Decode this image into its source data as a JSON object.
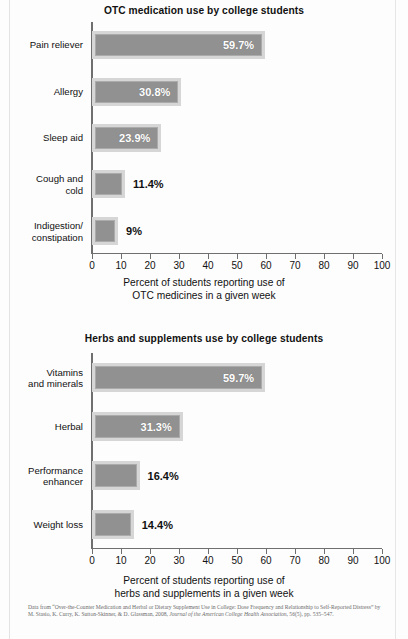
{
  "figures": [
    {
      "id": "otc",
      "title": "OTC medication use by college students",
      "axis_caption": "Percent of students reporting use of\nOTC medicines in a given week"
    },
    {
      "id": "herbs",
      "title": "Herbs and supplements use by college students",
      "axis_caption": "Percent of students reporting use of\nherbs and supplements in a given week"
    }
  ],
  "footnote": {
    "line1": "Data from “Over-the-Counter Medication and Herbal or Dietary Supplement Use in College: Dose Frequency and",
    "line2": "Relationship to Self-Reported Distress” by M. Stasio, K. Curry, K. Sutton-Skinner, & D. Glassman, 2008, ",
    "line2_italic": "Journal",
    "line3_italic": "of the American College Health Association",
    "line3": ", 56(5), pp. 535–547."
  },
  "colors": {
    "bar_fill": "#919191",
    "bar_frame": "#d6d6d6",
    "bar_inner_border": "#ababab",
    "axis": "#6f6f6f",
    "text": "#111111",
    "value_label_inside": "#ffffff",
    "page_background": "#fdfdfd"
  },
  "chart_data": [
    {
      "type": "bar",
      "orientation": "horizontal",
      "title": "OTC medication use by college students",
      "xlabel": "Percent of students reporting use of OTC medicines in a given week",
      "ylabel": "",
      "xlim": [
        0,
        100
      ],
      "xticks": [
        0,
        10,
        20,
        30,
        40,
        50,
        60,
        70,
        80,
        90,
        100
      ],
      "grid": false,
      "legend": "none",
      "categories": [
        "Pain reliever",
        "Allergy",
        "Sleep aid",
        "Cough and cold",
        "Indigestion/ constipation"
      ],
      "values": [
        59.7,
        30.8,
        23.9,
        11.4,
        9
      ],
      "data_labels": [
        "59.7%",
        "30.8%",
        "23.9%",
        "11.4%",
        "9%"
      ],
      "label_placement": [
        "inside",
        "inside",
        "inside",
        "outside",
        "outside"
      ]
    },
    {
      "type": "bar",
      "orientation": "horizontal",
      "title": "Herbs and supplements use by college students",
      "xlabel": "Percent of students reporting use of herbs and supplements in a given week",
      "ylabel": "",
      "xlim": [
        0,
        100
      ],
      "xticks": [
        0,
        10,
        20,
        30,
        40,
        50,
        60,
        70,
        80,
        90,
        100
      ],
      "grid": false,
      "legend": "none",
      "categories": [
        "Vitamins and minerals",
        "Herbal",
        "Performance enhancer",
        "Weight loss"
      ],
      "values": [
        59.7,
        31.3,
        16.4,
        14.4
      ],
      "data_labels": [
        "59.7%",
        "31.3%",
        "16.4%",
        "14.4%"
      ],
      "label_placement": [
        "inside",
        "inside",
        "outside",
        "outside"
      ]
    }
  ],
  "category_label_lines": {
    "otc": [
      [
        "Pain reliever"
      ],
      [
        "Allergy"
      ],
      [
        "Sleep aid"
      ],
      [
        "Cough and",
        "cold"
      ],
      [
        "Indigestion/",
        "constipation"
      ]
    ],
    "herbs": [
      [
        "Vitamins",
        "and minerals"
      ],
      [
        "Herbal"
      ],
      [
        "Performance",
        "enhancer"
      ],
      [
        "Weight loss"
      ]
    ]
  }
}
